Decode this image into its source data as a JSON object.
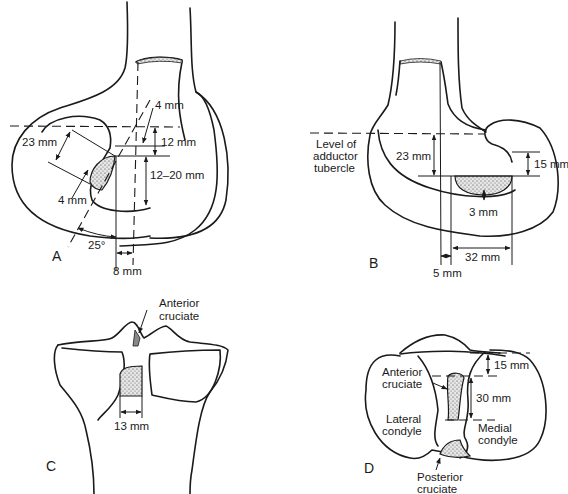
{
  "figure": {
    "panels": [
      {
        "id": "A",
        "label": "A",
        "view": "femur lateral view",
        "measurements": [
          "4 mm",
          "23 mm",
          "12 mm",
          "12–20 mm",
          "4 mm",
          "25°",
          "8 mm"
        ]
      },
      {
        "id": "B",
        "label": "B",
        "view": "femur view at adductor tubercle",
        "annotations": [
          "Level of",
          "adductor",
          "tubercle"
        ],
        "measurements": [
          "23 mm",
          "15 mm",
          "3 mm",
          "32 mm",
          "5 mm"
        ]
      },
      {
        "id": "C",
        "label": "C",
        "view": "tibia anterior view",
        "annotations": [
          "Anterior",
          "cruciate"
        ],
        "measurements": [
          "13 mm"
        ]
      },
      {
        "id": "D",
        "label": "D",
        "view": "tibial plateau superior view",
        "annotations": [
          "Anterior",
          "cruciate",
          "Lateral",
          "condyle",
          "Medial",
          "condyle",
          "Posterior",
          "cruciate"
        ],
        "measurements": [
          "15 mm",
          "30 mm"
        ]
      }
    ]
  },
  "panelA": {
    "label": "A",
    "m_4mm_top": "4 mm",
    "m_23mm": "23 mm",
    "m_12mm": "12 mm",
    "m_12_20mm": "12–20 mm",
    "m_4mm_left": "4 mm",
    "m_25deg": "25°",
    "m_8mm": "8 mm"
  },
  "panelB": {
    "label": "B",
    "level_line1": "Level of",
    "level_line2": "adductor",
    "level_line3": "tubercle",
    "m_23mm": "23 mm",
    "m_15mm": "15 mm",
    "m_3mm": "3 mm",
    "m_32mm": "32 mm",
    "m_5mm": "5 mm"
  },
  "panelC": {
    "label": "C",
    "ant_line1": "Anterior",
    "ant_line2": "cruciate",
    "m_13mm": "13 mm"
  },
  "panelD": {
    "label": "D",
    "ant_line1": "Anterior",
    "ant_line2": "cruciate",
    "lat_line1": "Lateral",
    "lat_line2": "condyle",
    "med_line1": "Medial",
    "med_line2": "condyle",
    "post_line1": "Posterior",
    "post_line2": "cruciate",
    "m_15mm": "15 mm",
    "m_30mm": "30 mm"
  }
}
